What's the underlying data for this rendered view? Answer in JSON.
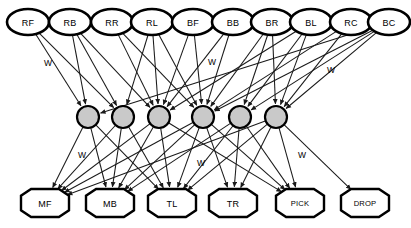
{
  "diagram": {
    "type": "neural-network",
    "title": "",
    "layers": {
      "input": {
        "shape": "ellipse",
        "rx": 21,
        "ry": 13,
        "cy": 22,
        "fill": "#ffffff",
        "stroke": "#000000",
        "nodes": [
          {
            "id": "RF",
            "label": "RF",
            "cx": 28
          },
          {
            "id": "RB",
            "label": "RB",
            "cx": 70
          },
          {
            "id": "RR",
            "label": "RR",
            "cx": 112
          },
          {
            "id": "RL",
            "label": "RL",
            "cx": 152
          },
          {
            "id": "BF",
            "label": "BF",
            "cx": 193
          },
          {
            "id": "BB",
            "label": "BB",
            "cx": 233
          },
          {
            "id": "BR",
            "label": "BR",
            "cx": 272
          },
          {
            "id": "BL",
            "label": "BL",
            "cx": 311
          },
          {
            "id": "RC",
            "label": "RC",
            "cx": 351
          },
          {
            "id": "BC",
            "label": "BC",
            "cx": 389
          }
        ]
      },
      "hidden": {
        "shape": "circle",
        "r": 11,
        "cy": 117,
        "fill": "#c9c9c9",
        "stroke": "#000000",
        "nodes": [
          {
            "id": "H1",
            "label": "",
            "cx": 88
          },
          {
            "id": "H2",
            "label": "",
            "cx": 123
          },
          {
            "id": "H3",
            "label": "",
            "cx": 159
          },
          {
            "id": "H4",
            "label": "",
            "cx": 203
          },
          {
            "id": "H5",
            "label": "",
            "cx": 240
          },
          {
            "id": "H6",
            "label": "",
            "cx": 276
          }
        ]
      },
      "output": {
        "shape": "octagon",
        "rx": 24,
        "ry": 14,
        "cy": 203,
        "fill": "#ffffff",
        "stroke": "#000000",
        "nodes": [
          {
            "id": "MF",
            "label": "MF",
            "cx": 45
          },
          {
            "id": "MB",
            "label": "MB",
            "cx": 110
          },
          {
            "id": "TL",
            "label": "TL",
            "cx": 172
          },
          {
            "id": "TR",
            "label": "TR",
            "cx": 233
          },
          {
            "id": "PICK",
            "label": "PICK",
            "cx": 300
          },
          {
            "id": "DROP",
            "label": "DROP",
            "cx": 365
          }
        ]
      }
    },
    "weight_labels": [
      {
        "text": "W",
        "x": 48,
        "y": 63
      },
      {
        "text": "W",
        "x": 212,
        "y": 62
      },
      {
        "text": "W",
        "x": 331,
        "y": 70
      },
      {
        "text": "W",
        "x": 82,
        "y": 155
      },
      {
        "text": "W",
        "x": 201,
        "y": 163
      },
      {
        "text": "W",
        "x": 302,
        "y": 155
      }
    ],
    "edges_input_to_hidden": [
      [
        "RF",
        "H1"
      ],
      [
        "RF",
        "H2"
      ],
      [
        "RB",
        "H1"
      ],
      [
        "RB",
        "H2"
      ],
      [
        "RB",
        "H3"
      ],
      [
        "RR",
        "H3"
      ],
      [
        "RR",
        "H4"
      ],
      [
        "RL",
        "H2"
      ],
      [
        "RL",
        "H3"
      ],
      [
        "RL",
        "H4"
      ],
      [
        "BF",
        "H3"
      ],
      [
        "BF",
        "H4"
      ],
      [
        "BB",
        "H3"
      ],
      [
        "BB",
        "H4"
      ],
      [
        "BR",
        "H4"
      ],
      [
        "BR",
        "H5"
      ],
      [
        "BR",
        "H6"
      ],
      [
        "BL",
        "H3"
      ],
      [
        "BL",
        "H5"
      ],
      [
        "BL",
        "H6"
      ],
      [
        "RC",
        "H4"
      ],
      [
        "RC",
        "H6"
      ],
      [
        "BC",
        "H1"
      ],
      [
        "BC",
        "H4"
      ],
      [
        "BC",
        "H5"
      ],
      [
        "BC",
        "H6"
      ]
    ],
    "edges_hidden_to_output": [
      [
        "H1",
        "MF"
      ],
      [
        "H1",
        "MB"
      ],
      [
        "H1",
        "TL"
      ],
      [
        "H2",
        "MF"
      ],
      [
        "H2",
        "MB"
      ],
      [
        "H2",
        "TL"
      ],
      [
        "H3",
        "MF"
      ],
      [
        "H3",
        "MB"
      ],
      [
        "H3",
        "TL"
      ],
      [
        "H3",
        "PICK"
      ],
      [
        "H4",
        "MF"
      ],
      [
        "H4",
        "MB"
      ],
      [
        "H4",
        "TL"
      ],
      [
        "H4",
        "TR"
      ],
      [
        "H4",
        "PICK"
      ],
      [
        "H5",
        "MB"
      ],
      [
        "H5",
        "TL"
      ],
      [
        "H5",
        "TR"
      ],
      [
        "H5",
        "PICK"
      ],
      [
        "H6",
        "MF"
      ],
      [
        "H6",
        "TL"
      ],
      [
        "H6",
        "TR"
      ],
      [
        "H6",
        "PICK"
      ],
      [
        "H6",
        "DROP"
      ]
    ]
  }
}
